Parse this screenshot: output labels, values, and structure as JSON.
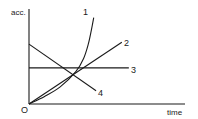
{
  "chart_data": {
    "type": "line",
    "title": "",
    "xlabel": "time",
    "ylabel": "acc.",
    "origin_label": "O",
    "grid": false,
    "legend": "inline labels at line ends",
    "xlim": [
      0,
      10
    ],
    "ylim": [
      0,
      10
    ],
    "series": [
      {
        "name": "1",
        "description": "exponentially increasing acceleration",
        "x": [
          0,
          1,
          2,
          3,
          3.5,
          3.8,
          4.0,
          4.15
        ],
        "y": [
          0,
          0.8,
          1.8,
          3.4,
          4.8,
          6.3,
          7.8,
          9.1
        ]
      },
      {
        "name": "2",
        "description": "linearly increasing acceleration",
        "x": [
          0,
          5.95
        ],
        "y": [
          0,
          6.5
        ]
      },
      {
        "name": "3",
        "description": "constant acceleration",
        "x": [
          0,
          6.4
        ],
        "y": [
          3.8,
          3.8
        ]
      },
      {
        "name": "4",
        "description": "linearly decreasing acceleration",
        "x": [
          0,
          4.3
        ],
        "y": [
          6.3,
          1.4
        ]
      }
    ]
  },
  "labels": {
    "y_axis": "acc.",
    "x_axis": "time",
    "origin": "O",
    "series_1": "1",
    "series_2": "2",
    "series_3": "3",
    "series_4": "4"
  }
}
